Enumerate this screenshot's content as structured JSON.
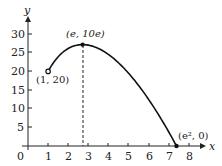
{
  "chart_data": {
    "type": "line",
    "title": "",
    "xlabel": "x",
    "ylabel": "y",
    "function": "y = 10x(2 - ln x)",
    "xlim": [
      0,
      8.5
    ],
    "ylim": [
      0,
      32
    ],
    "x_ticks": [
      1,
      2,
      3,
      4,
      5,
      6,
      7,
      8
    ],
    "y_ticks": [
      5,
      10,
      15,
      20,
      25,
      30
    ],
    "origin_label": "0",
    "grid": false,
    "series": [
      {
        "name": "f(x)",
        "x": [
          1,
          1.5,
          2,
          2.5,
          2.718,
          3,
          3.5,
          4,
          4.5,
          5,
          5.5,
          6,
          6.5,
          7,
          7.389
        ],
        "values": [
          20,
          23.92,
          26.14,
          27.09,
          27.18,
          27.04,
          26.15,
          24.55,
          22.32,
          19.53,
          16.24,
          12.49,
          8.33,
          3.79,
          0
        ]
      }
    ],
    "points": [
      {
        "label": "(1, 20)",
        "x": 1,
        "y": 20,
        "marker": "open-circle"
      },
      {
        "label": "(e, 10e)",
        "x": 2.718,
        "y": 27.18,
        "marker": "filled-circle"
      },
      {
        "label": "(e², 0)",
        "x": 7.389,
        "y": 0,
        "marker": "filled-circle"
      }
    ],
    "annotations": [
      {
        "type": "dashed-vertical-line",
        "x": 2.718,
        "from_y": 0,
        "to_y": 27.18
      }
    ]
  },
  "labels": {
    "y_axis": "y",
    "x_axis": "x",
    "origin": "0",
    "x_ticks": [
      "1",
      "2",
      "3",
      "4",
      "5",
      "6",
      "7",
      "8"
    ],
    "y_ticks": [
      "5",
      "10",
      "15",
      "20",
      "25",
      "30"
    ],
    "p1": "(1, 20)",
    "p2": "(e, 10e)",
    "p3": "(e², 0)"
  }
}
